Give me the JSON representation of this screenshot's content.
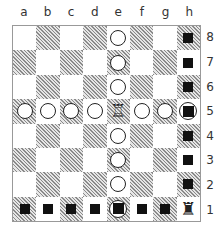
{
  "files": [
    "a",
    "b",
    "c",
    "d",
    "e",
    "f",
    "g",
    "h"
  ],
  "ranks": [
    "8",
    "7",
    "6",
    "5",
    "4",
    "3",
    "2",
    "1"
  ],
  "board": [
    [
      "",
      "",
      "",
      "",
      "circle",
      "",
      "",
      "block"
    ],
    [
      "",
      "",
      "",
      "",
      "circle",
      "",
      "",
      "block"
    ],
    [
      "",
      "",
      "",
      "",
      "circle",
      "",
      "",
      "block"
    ],
    [
      "circle",
      "circle",
      "circle",
      "circle",
      "white-rook",
      "circle",
      "circle",
      "ring-block"
    ],
    [
      "",
      "",
      "",
      "",
      "circle",
      "",
      "",
      "block"
    ],
    [
      "",
      "",
      "",
      "",
      "circle",
      "",
      "",
      "block"
    ],
    [
      "",
      "",
      "",
      "",
      "circle",
      "",
      "",
      "block"
    ],
    [
      "block",
      "block",
      "block",
      "block",
      "ring-block",
      "block",
      "block",
      "black-rook"
    ]
  ],
  "legend": {
    "circle": "attacked-square-marker",
    "block": "black-square-marker",
    "ring-block": "combined-marker",
    "white-rook": "♖",
    "black-rook": "♜"
  },
  "colors": {
    "hatch_dark": "#8a8a8a",
    "light": "#ffffff",
    "border": "#999999",
    "marker": "#111111"
  }
}
